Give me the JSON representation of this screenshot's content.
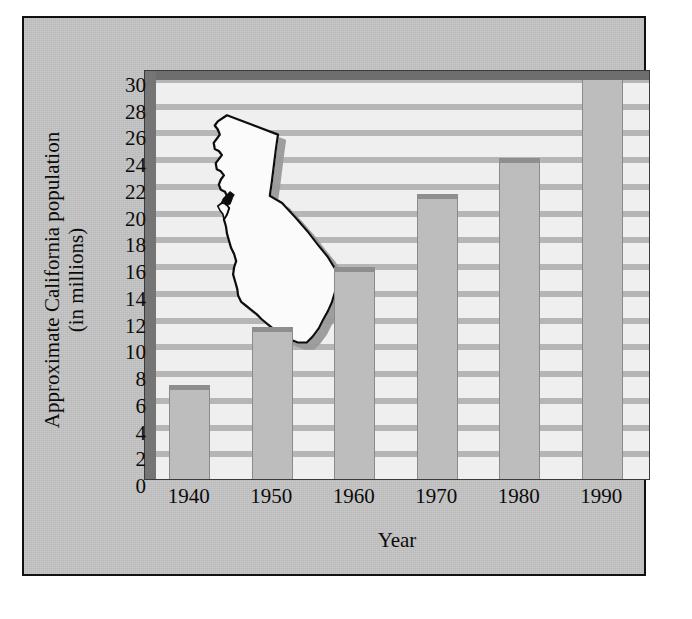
{
  "chart_data": {
    "type": "bar",
    "title": "",
    "subtitle": "",
    "xlabel": "Year",
    "ylabel": "Approximate California population (in millions)",
    "ylabel_line1": "Approximate California population",
    "ylabel_line2": "(in millions)",
    "categories": [
      "1940",
      "1950",
      "1960",
      "1970",
      "1980",
      "1990"
    ],
    "values": [
      7.2,
      11.5,
      16.0,
      21.5,
      24.2,
      30.0
    ],
    "ylim": [
      0,
      30
    ],
    "ytick_step": 2,
    "yticks": [
      "0",
      "2",
      "4",
      "6",
      "8",
      "10",
      "12",
      "14",
      "16",
      "18",
      "20",
      "22",
      "24",
      "26",
      "28",
      "30"
    ],
    "ytick_values": [
      0,
      2,
      4,
      6,
      8,
      10,
      12,
      14,
      16,
      18,
      20,
      22,
      24,
      26,
      28,
      30
    ],
    "grid": "horizontal banded",
    "legend": "none",
    "annotations": [
      "California state outline silhouette overlaid on plot background"
    ],
    "series": [
      {
        "name": "Approximate California population (in millions)",
        "values": [
          7.2,
          11.5,
          16.0,
          21.5,
          24.2,
          30.0
        ]
      }
    ],
    "colors": {
      "bar_face": "#bdbdbd",
      "bar_cap": "#8e8e8e",
      "plot_background": "#efefef",
      "gridband": "#b6b6b6",
      "card_background": "#c3c3c3",
      "frame_border": "#111111",
      "text": "#0b0b0b",
      "map_fill": "#fbfbfb",
      "map_outline": "#101010"
    }
  }
}
